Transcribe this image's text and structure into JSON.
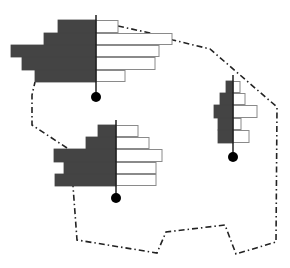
{
  "diagram": {
    "type": "population-pyramid-map",
    "colors": {
      "left_bar": "#444444",
      "right_bar": "#ffffff",
      "bar_stroke": "#8a8a8a",
      "axis": "#111111",
      "dot": "#000000",
      "boundary": "#222222"
    },
    "boundary_points": [
      [
        118,
        26
      ],
      [
        150,
        33
      ],
      [
        173,
        40
      ],
      [
        210,
        49
      ],
      [
        277,
        107
      ],
      [
        276,
        242
      ],
      [
        236,
        254
      ],
      [
        225,
        225
      ],
      [
        166,
        232
      ],
      [
        157,
        253
      ],
      [
        77,
        240
      ],
      [
        73,
        186
      ]
    ],
    "boundary_left_points": [
      [
        67,
        148
      ],
      [
        32,
        125
      ],
      [
        32,
        95
      ],
      [
        35,
        82
      ]
    ],
    "pyramids": [
      {
        "name": "pyramid-northwest",
        "axis_x": 96,
        "axis_top": 15,
        "dot_y": 97,
        "dot_r": 5,
        "rows": [
          {
            "y": 20,
            "h": 13,
            "left": 58,
            "right": 118
          },
          {
            "y": 33,
            "h": 12,
            "left": 44,
            "right": 172
          },
          {
            "y": 45,
            "h": 12,
            "left": 11,
            "right": 159
          },
          {
            "y": 57,
            "h": 13,
            "left": 22,
            "right": 155
          },
          {
            "y": 70,
            "h": 12,
            "left": 35,
            "right": 125
          }
        ]
      },
      {
        "name": "pyramid-east",
        "axis_x": 233,
        "axis_top": 75,
        "dot_y": 157,
        "dot_r": 5,
        "rows": [
          {
            "y": 81,
            "h": 12,
            "left": 226,
            "right": 240
          },
          {
            "y": 93,
            "h": 12,
            "left": 220,
            "right": 245
          },
          {
            "y": 105,
            "h": 13,
            "left": 214,
            "right": 257
          },
          {
            "y": 118,
            "h": 12,
            "left": 218,
            "right": 241
          },
          {
            "y": 130,
            "h": 13,
            "left": 218,
            "right": 249
          }
        ]
      },
      {
        "name": "pyramid-southwest",
        "axis_x": 116,
        "axis_top": 120,
        "dot_y": 198,
        "dot_r": 5,
        "rows": [
          {
            "y": 125,
            "h": 12,
            "left": 98,
            "right": 138
          },
          {
            "y": 137,
            "h": 12,
            "left": 86,
            "right": 149
          },
          {
            "y": 149,
            "h": 13,
            "left": 54,
            "right": 162
          },
          {
            "y": 162,
            "h": 12,
            "left": 64,
            "right": 156
          },
          {
            "y": 174,
            "h": 12,
            "left": 55,
            "right": 156
          }
        ]
      }
    ]
  }
}
